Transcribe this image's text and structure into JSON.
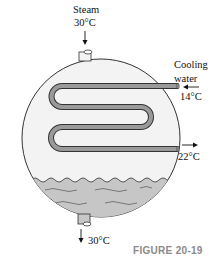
{
  "diagram": {
    "steam_label": "Steam",
    "steam_temp": "30°C",
    "cooling_label_line1": "Cooling",
    "cooling_label_line2": "water",
    "cooling_in_temp": "14°C",
    "cooling_out_temp": "22°C",
    "condensate_temp": "30°C",
    "figure_caption": "FIGURE 20-19",
    "colors": {
      "vessel_fill": "#f2f2f2",
      "liquid_fill": "#c8c8c8",
      "coil_fill": "#9a9a9a",
      "outline": "#333333",
      "caption": "#8a8a8a"
    }
  }
}
